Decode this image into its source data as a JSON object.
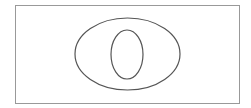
{
  "diagram": {
    "type": "nested-ellipses",
    "stroke_color": "#555555",
    "frame_color": "#999999",
    "background": "#ffffff",
    "frame": {
      "x": 15.5,
      "y": 5.5,
      "width": 224,
      "height": 98
    },
    "outer_ellipse": {
      "cx": 127.5,
      "cy": 54,
      "rx": 52.5,
      "ry": 36
    },
    "inner_ellipse": {
      "cx": 127,
      "cy": 54.5,
      "rx": 16,
      "ry": 24.5
    }
  }
}
